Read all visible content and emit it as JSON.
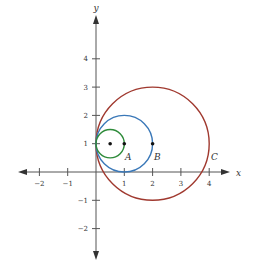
{
  "diagram": {
    "type": "coordinate-plane-circles",
    "axes": {
      "x_label": "x",
      "y_label": "y",
      "x_ticks": [
        "−2",
        "−1",
        "1",
        "2",
        "3",
        "4"
      ],
      "y_ticks": [
        "4",
        "3",
        "2",
        "1",
        "−1",
        "−2"
      ]
    },
    "circles": [
      {
        "name": "green",
        "label": "",
        "center": [
          0.5,
          1
        ],
        "radius": 0.5,
        "color": "#2e8b3a"
      },
      {
        "name": "A",
        "label": "A",
        "center": [
          1,
          1
        ],
        "radius": 1,
        "color": "#3a78b8"
      },
      {
        "name": "C",
        "label": "C",
        "center": [
          2,
          1
        ],
        "radius": 2,
        "color": "#a0392f"
      }
    ],
    "points": [
      {
        "coords": [
          0.5,
          1
        ]
      },
      {
        "coords": [
          1,
          1
        ]
      },
      {
        "coords": [
          2,
          1
        ]
      }
    ],
    "labels": {
      "A": "A",
      "B": "B",
      "C": "C"
    },
    "colors": {
      "axis": "#555555",
      "green": "#2e8b3a",
      "blue": "#3a78b8",
      "red": "#a0392f"
    }
  }
}
